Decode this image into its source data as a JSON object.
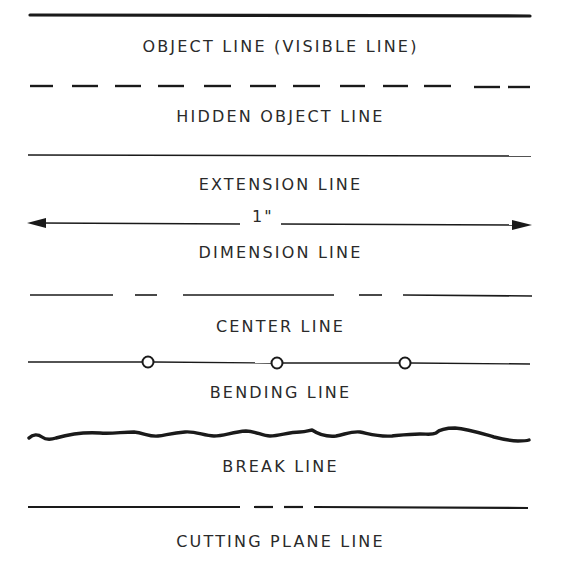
{
  "diagram": {
    "ink_color": "#1a1a1a",
    "text_color": "#2a2a2a",
    "background": "#ffffff",
    "lines": [
      {
        "id": "object",
        "label": "OBJECT LINE (VISIBLE LINE)",
        "style": "solid-thick"
      },
      {
        "id": "hidden",
        "label": "HIDDEN OBJECT LINE",
        "style": "dashed"
      },
      {
        "id": "extension",
        "label": "EXTENSION LINE",
        "style": "solid-thin"
      },
      {
        "id": "dimension",
        "label": "DIMENSION LINE",
        "style": "arrow-both",
        "value": "1\""
      },
      {
        "id": "center",
        "label": "CENTER LINE",
        "style": "long-short-dash"
      },
      {
        "id": "bending",
        "label": "BENDING LINE",
        "style": "line-with-circles"
      },
      {
        "id": "break",
        "label": "BREAK LINE",
        "style": "wavy-freehand"
      },
      {
        "id": "cutting",
        "label": "CUTTING PLANE LINE",
        "style": "long-dash-dash-long"
      }
    ]
  }
}
